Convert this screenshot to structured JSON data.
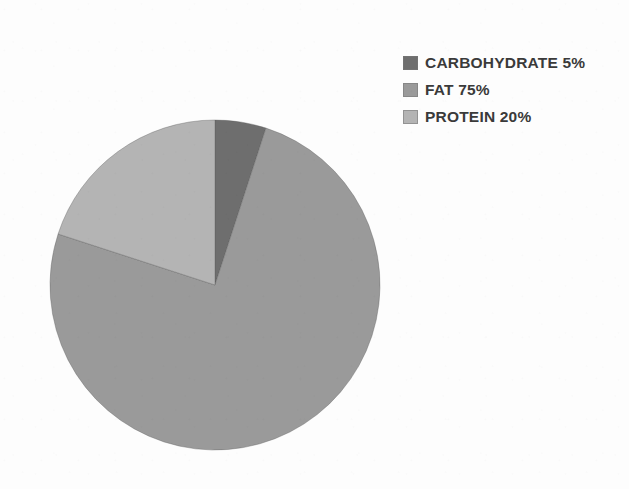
{
  "background_color": "#fdfdfd",
  "chart_data": {
    "type": "pie",
    "title": "",
    "legend_position": "top-right",
    "start_angle_deg": 0,
    "direction": "clockwise",
    "center": {
      "x": 215,
      "y": 285
    },
    "radius": 166,
    "categories": [
      "CARBOHYDRATE",
      "FAT",
      "PROTEIN"
    ],
    "values": [
      5,
      75,
      20
    ],
    "value_unit": "%",
    "colors": [
      "#6e6e6e",
      "#9a9a9a",
      "#b4b4b4"
    ],
    "slices": [
      {
        "label": "CARBOHYDRATE",
        "value": 5,
        "display_value": "5%",
        "legend_text": "CARBOHYDRATE 5%",
        "color": "#6e6e6e",
        "start_angle_deg": 0,
        "end_angle_deg": 18
      },
      {
        "label": "FAT",
        "value": 75,
        "display_value": "75%",
        "legend_text": "FAT 75%",
        "color": "#9a9a9a",
        "start_angle_deg": 18,
        "end_angle_deg": 288
      },
      {
        "label": "PROTEIN",
        "value": 20,
        "display_value": "20%",
        "legend_text": "PROTEIN 20%",
        "color": "#b4b4b4",
        "start_angle_deg": 288,
        "end_angle_deg": 360
      }
    ]
  },
  "legend": {
    "items": [
      {
        "text": "CARBOHYDRATE 5%",
        "color": "#6e6e6e"
      },
      {
        "text": "FAT 75%",
        "color": "#9a9a9a"
      },
      {
        "text": "PROTEIN 20%",
        "color": "#b4b4b4"
      }
    ]
  }
}
